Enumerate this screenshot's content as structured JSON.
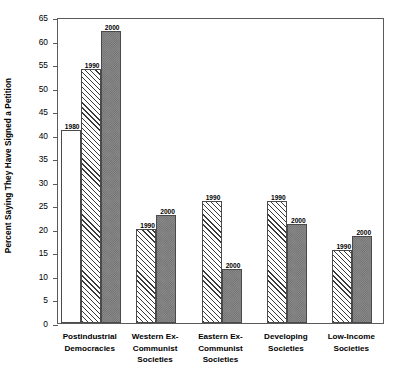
{
  "chart_data": {
    "type": "bar",
    "title": "",
    "xlabel": "",
    "ylabel": "Percent Saying They Have Signed a Petition",
    "ylim": [
      0,
      65
    ],
    "ytick_step": 5,
    "yticks": [
      0,
      5,
      10,
      15,
      20,
      25,
      30,
      35,
      40,
      45,
      50,
      55,
      60,
      65
    ],
    "grid": false,
    "legend": "none",
    "categories": [
      "Postindustrial Democracies",
      "Western Ex-Communist Societies",
      "Eastern Ex-Communist Societies",
      "Developing Societies",
      "Low-Income Societies"
    ],
    "category_lines": [
      [
        "Postindustrial",
        "Democracies"
      ],
      [
        "Western Ex-",
        "Communist",
        "Societies"
      ],
      [
        "Eastern Ex-",
        "Communist",
        "Societies"
      ],
      [
        "Developing",
        "Societies"
      ],
      [
        "Low-Income",
        "Societies"
      ]
    ],
    "series": [
      {
        "name": "1980",
        "pattern": "dots",
        "values": [
          41,
          null,
          null,
          null,
          null
        ]
      },
      {
        "name": "1990",
        "pattern": "hatch",
        "values": [
          54,
          20,
          26,
          26,
          15.5
        ]
      },
      {
        "name": "2000",
        "pattern": "check",
        "values": [
          62,
          23,
          11.5,
          21,
          18.5
        ]
      }
    ],
    "bars": [
      {
        "group": 0,
        "series": "1980",
        "value": 41,
        "label": "1980",
        "pattern": "dots"
      },
      {
        "group": 0,
        "series": "1990",
        "value": 54,
        "label": "1990",
        "pattern": "hatch"
      },
      {
        "group": 0,
        "series": "2000",
        "value": 62,
        "label": "2000",
        "pattern": "check"
      },
      {
        "group": 1,
        "series": "1990",
        "value": 20,
        "label": "1990",
        "pattern": "hatch"
      },
      {
        "group": 1,
        "series": "2000",
        "value": 23,
        "label": "2000",
        "pattern": "check"
      },
      {
        "group": 2,
        "series": "1990",
        "value": 26,
        "label": "1990",
        "pattern": "hatch"
      },
      {
        "group": 2,
        "series": "2000",
        "value": 11.5,
        "label": "2000",
        "pattern": "check"
      },
      {
        "group": 3,
        "series": "1990",
        "value": 26,
        "label": "1990",
        "pattern": "hatch"
      },
      {
        "group": 3,
        "series": "2000",
        "value": 21,
        "label": "2000",
        "pattern": "check"
      },
      {
        "group": 4,
        "series": "1990",
        "value": 15.5,
        "label": "1990",
        "pattern": "hatch"
      },
      {
        "group": 4,
        "series": "2000",
        "value": 18.5,
        "label": "2000",
        "pattern": "check"
      }
    ]
  },
  "colors": {
    "axis": "#5a5a5a",
    "bar_outline": "#4a4a4a",
    "fill_1980": "#e8e8e8",
    "fill_1990": "#ffffff",
    "fill_2000": "#8c8c8c",
    "background": "#ffffff"
  }
}
